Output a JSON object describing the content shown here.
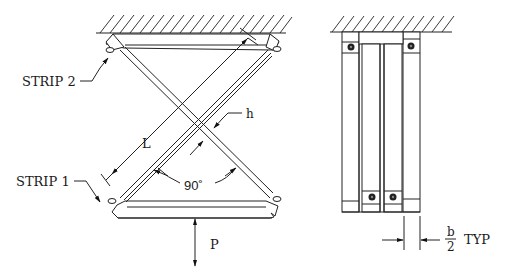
{
  "figure": {
    "type": "engineering-diagram",
    "left_view": {
      "labels": {
        "strip2": "STRIP  2",
        "strip1": "STRIP  1",
        "length": "L",
        "thickness": "h",
        "angle": "90˚",
        "load": "P"
      }
    },
    "right_view": {
      "labels": {
        "width_numerator": "b",
        "width_denominator": "2",
        "width_suffix": "TYP"
      }
    },
    "colors": {
      "line": "#222222",
      "background": "#ffffff"
    }
  }
}
